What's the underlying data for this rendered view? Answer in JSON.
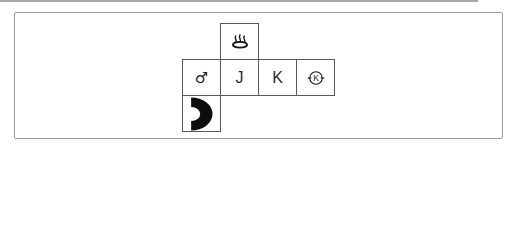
{
  "colors": {
    "background": "#ffffff",
    "panel_border": "#9b9b9b",
    "net_line": "#595959",
    "cube_line": "#4a4a4a",
    "ink": "#161616",
    "shape_fill": "#0d0d0d",
    "scan_artifact": "#a8a8a8",
    "number_color": "#4d4d4d"
  },
  "symbols": {
    "onsen": "♨",
    "male": "♂",
    "circle_k_letter": "K"
  },
  "net": {
    "cell_w": 38,
    "cell_h": 36,
    "cells": [
      {
        "row": 0,
        "col": 1,
        "type": "onsen"
      },
      {
        "row": 1,
        "col": 0,
        "type": "male"
      },
      {
        "row": 1,
        "col": 1,
        "type": "letter",
        "text": "J"
      },
      {
        "row": 1,
        "col": 2,
        "type": "letter",
        "text": "K"
      },
      {
        "row": 1,
        "col": 3,
        "type": "circle-k"
      },
      {
        "row": 2,
        "col": 0,
        "type": "half-donut",
        "shape": {
          "opening": "left",
          "cx": 0.22,
          "cy": 0.5,
          "R": 0.47,
          "r": 0.2,
          "stretch": 1.3
        }
      }
    ]
  },
  "options": [
    {
      "number": "①",
      "top": {
        "type": "onsen"
      },
      "right": {
        "type": "letter",
        "text": "J"
      },
      "front_shape": {
        "opening": "right",
        "cx": 0.45,
        "cy": 0.5,
        "R": 0.48,
        "r": 0.2,
        "stretch": 1
      }
    },
    {
      "number": "②",
      "top": {
        "type": "circle-k"
      },
      "right": {
        "type": "male"
      },
      "front_shape": {
        "opening": "up",
        "cx": 0.5,
        "cy": 0.53,
        "R": 0.45,
        "r": 0.2,
        "stretch": 1
      }
    },
    {
      "number": "③",
      "top": {
        "type": "letter",
        "text": "J"
      },
      "right": {
        "type": "onsen"
      },
      "front_shape": {
        "opening": "down",
        "cx": 0.5,
        "cy": 0.42,
        "R": 0.42,
        "r": 0.19,
        "stretch": 1
      }
    },
    {
      "number": "④",
      "top": {
        "type": "male"
      },
      "right": {
        "type": "letter",
        "text": "K"
      },
      "front_shape": {
        "opening": "left",
        "cx": 0.5,
        "cy": 0.5,
        "R": 0.47,
        "r": 0.21,
        "stretch": 1
      }
    }
  ]
}
